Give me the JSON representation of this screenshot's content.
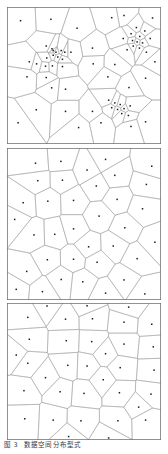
{
  "figure": {
    "caption_label": "图 3",
    "caption_text": "数据空间分布型式",
    "width": 168,
    "height": 454,
    "background": "#ffffff",
    "edge_color": "#9a9a9a",
    "frame_color": "#6e6e6e",
    "point_color": "#1a1a1a"
  },
  "panels": [
    {
      "name": "clustered",
      "label": "(a)",
      "x": 7,
      "y": 7,
      "w": 154,
      "h": 137,
      "distribution": "clustered",
      "point_count": 63,
      "description": "Voronoi tessellation of a clustered (aggregated) point pattern with three dense clusters"
    },
    {
      "name": "random",
      "label": "(b)",
      "x": 7,
      "y": 148,
      "w": 154,
      "h": 152,
      "distribution": "random",
      "point_count": 36,
      "description": "Voronoi tessellation of a completely spatially random (Poisson) point pattern"
    },
    {
      "name": "regular",
      "label": "(c)",
      "x": 7,
      "y": 303,
      "w": 154,
      "h": 137,
      "distribution": "regular",
      "point_count": 35,
      "description": "Voronoi tessellation of a regular (evenly dispersed) point pattern"
    }
  ],
  "chart_data": {
    "type": "scatter",
    "title": "数据空间分布型式",
    "xlabel": "",
    "ylabel": "",
    "xlim": [
      0,
      1
    ],
    "ylim": [
      0,
      1
    ],
    "grid": false,
    "legend": "none",
    "overlay": "voronoi-tessellation",
    "series": [
      {
        "name": "clustered",
        "panel": 0,
        "points": [
          [
            0.088,
            0.1
          ],
          [
            0.285,
            0.09
          ],
          [
            0.455,
            0.155
          ],
          [
            0.68,
            0.078
          ],
          [
            0.76,
            0.062
          ],
          [
            0.945,
            0.08
          ],
          [
            0.84,
            0.15
          ],
          [
            0.895,
            0.175
          ],
          [
            0.806,
            0.195
          ],
          [
            0.862,
            0.215
          ],
          [
            0.93,
            0.23
          ],
          [
            0.755,
            0.23
          ],
          [
            0.815,
            0.245
          ],
          [
            0.845,
            0.255
          ],
          [
            0.88,
            0.262
          ],
          [
            0.82,
            0.285
          ],
          [
            0.86,
            0.3
          ],
          [
            0.78,
            0.312
          ],
          [
            0.905,
            0.33
          ],
          [
            0.255,
            0.285
          ],
          [
            0.292,
            0.305
          ],
          [
            0.3,
            0.318
          ],
          [
            0.318,
            0.33
          ],
          [
            0.352,
            0.318
          ],
          [
            0.375,
            0.33
          ],
          [
            0.415,
            0.33
          ],
          [
            0.3,
            0.352
          ],
          [
            0.33,
            0.365
          ],
          [
            0.258,
            0.372
          ],
          [
            0.36,
            0.382
          ],
          [
            0.145,
            0.4
          ],
          [
            0.192,
            0.415
          ],
          [
            0.25,
            0.432
          ],
          [
            0.295,
            0.43
          ],
          [
            0.36,
            0.435
          ],
          [
            0.555,
            0.3
          ],
          [
            0.56,
            0.415
          ],
          [
            0.7,
            0.42
          ],
          [
            0.96,
            0.4
          ],
          [
            0.13,
            0.51
          ],
          [
            0.255,
            0.515
          ],
          [
            0.655,
            0.51
          ],
          [
            0.9,
            0.52
          ],
          [
            0.29,
            0.59
          ],
          [
            0.38,
            0.6
          ],
          [
            0.792,
            0.588
          ],
          [
            0.66,
            0.68
          ],
          [
            0.7,
            0.7
          ],
          [
            0.735,
            0.712
          ],
          [
            0.68,
            0.735
          ],
          [
            0.718,
            0.748
          ],
          [
            0.76,
            0.742
          ],
          [
            0.8,
            0.722
          ],
          [
            0.745,
            0.778
          ],
          [
            0.788,
            0.792
          ],
          [
            0.19,
            0.75
          ],
          [
            0.38,
            0.762
          ],
          [
            0.555,
            0.762
          ],
          [
            0.072,
            0.845
          ],
          [
            0.465,
            0.88
          ],
          [
            0.61,
            0.845
          ],
          [
            0.805,
            0.872
          ],
          [
            0.9,
            0.838
          ]
        ]
      },
      {
        "name": "random",
        "panel": 1,
        "points": [
          [
            0.35,
            0.088
          ],
          [
            0.64,
            0.075
          ],
          [
            0.52,
            0.145
          ],
          [
            0.2,
            0.215
          ],
          [
            0.36,
            0.212
          ],
          [
            0.58,
            0.25
          ],
          [
            0.905,
            0.24
          ],
          [
            0.105,
            0.36
          ],
          [
            0.265,
            0.35
          ],
          [
            0.432,
            0.345
          ],
          [
            0.715,
            0.338
          ],
          [
            0.88,
            0.4
          ],
          [
            0.598,
            0.448
          ],
          [
            0.432,
            0.532
          ],
          [
            0.765,
            0.525
          ],
          [
            0.175,
            0.572
          ],
          [
            0.31,
            0.568
          ],
          [
            0.53,
            0.65
          ],
          [
            0.69,
            0.645
          ],
          [
            0.262,
            0.735
          ],
          [
            0.432,
            0.732
          ],
          [
            0.585,
            0.752
          ],
          [
            0.845,
            0.728
          ],
          [
            0.128,
            0.812
          ],
          [
            0.352,
            0.865
          ],
          [
            0.492,
            0.88
          ],
          [
            0.76,
            0.868
          ],
          [
            0.06,
            0.93
          ],
          [
            0.23,
            0.945
          ],
          [
            0.64,
            0.955
          ],
          [
            0.895,
            0.96
          ],
          [
            0.94,
            0.12
          ],
          [
            0.05,
            0.47
          ],
          [
            0.96,
            0.62
          ],
          [
            0.185,
            0.1
          ],
          [
            0.7,
            0.18
          ]
        ]
      },
      {
        "name": "regular",
        "panel": 2,
        "points": [
          [
            0.135,
            0.105
          ],
          [
            0.38,
            0.118
          ],
          [
            0.555,
            0.115
          ],
          [
            0.76,
            0.14
          ],
          [
            0.94,
            0.155
          ],
          [
            0.145,
            0.265
          ],
          [
            0.385,
            0.275
          ],
          [
            0.55,
            0.282
          ],
          [
            0.76,
            0.3
          ],
          [
            0.95,
            0.32
          ],
          [
            0.135,
            0.44
          ],
          [
            0.395,
            0.455
          ],
          [
            0.52,
            0.46
          ],
          [
            0.735,
            0.472
          ],
          [
            0.955,
            0.49
          ],
          [
            0.11,
            0.64
          ],
          [
            0.345,
            0.648
          ],
          [
            0.5,
            0.66
          ],
          [
            0.73,
            0.655
          ],
          [
            0.935,
            0.665
          ],
          [
            0.115,
            0.845
          ],
          [
            0.3,
            0.855
          ],
          [
            0.48,
            0.86
          ],
          [
            0.72,
            0.86
          ],
          [
            0.9,
            0.855
          ],
          [
            0.26,
            0.022
          ],
          [
            0.52,
            0.02
          ],
          [
            0.79,
            0.03
          ],
          [
            0.06,
            0.38
          ],
          [
            0.64,
            0.37
          ],
          [
            0.25,
            0.545
          ],
          [
            0.625,
            0.56
          ],
          [
            0.855,
            0.76
          ],
          [
            0.4,
            0.975
          ],
          [
            0.66,
            0.985
          ]
        ]
      }
    ]
  }
}
